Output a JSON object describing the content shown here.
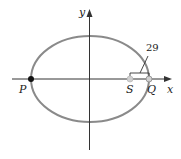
{
  "diagram": {
    "type": "ellipse-orbit",
    "colors": {
      "axis": "#333333",
      "ellipse": "#8a8a8a",
      "point_P": "#111111",
      "point_S": "#cfcfcf",
      "point_Q": "#bdbdbd",
      "bracket": "#333333"
    },
    "axes": {
      "x_label": "x",
      "y_label": "y"
    },
    "ellipse": {
      "cx": 90,
      "cy": 79,
      "rx": 59,
      "ry": 43
    },
    "points": [
      {
        "id": "P",
        "label": "P",
        "x": 31,
        "y": 79
      },
      {
        "id": "S",
        "label": "S",
        "x": 130,
        "y": 79
      },
      {
        "id": "Q",
        "label": "Q",
        "x": 149,
        "y": 79
      }
    ],
    "annotation": {
      "value": "29",
      "from": "S",
      "to": "Q"
    }
  }
}
